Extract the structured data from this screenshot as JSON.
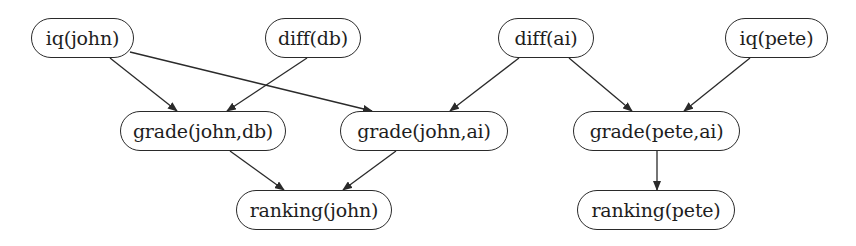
{
  "diagram": {
    "type": "directed-graph",
    "title": "",
    "nodes": [
      {
        "id": "iq_john",
        "label": "iq(john)",
        "x": 31,
        "y": 18,
        "w": 103,
        "h": 40
      },
      {
        "id": "diff_db",
        "label": "diff(db)",
        "x": 265,
        "y": 18,
        "w": 96,
        "h": 40
      },
      {
        "id": "diff_ai",
        "label": "diff(ai)",
        "x": 498,
        "y": 18,
        "w": 96,
        "h": 40
      },
      {
        "id": "iq_pete",
        "label": "iq(pete)",
        "x": 725,
        "y": 18,
        "w": 103,
        "h": 40
      },
      {
        "id": "grade_john_db",
        "label": "grade(john,db)",
        "x": 120,
        "y": 111,
        "w": 166,
        "h": 40
      },
      {
        "id": "grade_john_ai",
        "label": "grade(john,ai)",
        "x": 340,
        "y": 111,
        "w": 168,
        "h": 40
      },
      {
        "id": "grade_pete_ai",
        "label": "grade(pete,ai)",
        "x": 573,
        "y": 111,
        "w": 167,
        "h": 40
      },
      {
        "id": "ranking_john",
        "label": "ranking(john)",
        "x": 236,
        "y": 190,
        "w": 156,
        "h": 40
      },
      {
        "id": "ranking_pete",
        "label": "ranking(pete)",
        "x": 577,
        "y": 190,
        "w": 158,
        "h": 40
      }
    ],
    "edges": [
      {
        "from": "iq_john",
        "to": "grade_john_db"
      },
      {
        "from": "iq_john",
        "to": "grade_john_ai"
      },
      {
        "from": "diff_db",
        "to": "grade_john_db"
      },
      {
        "from": "diff_ai",
        "to": "grade_john_ai"
      },
      {
        "from": "diff_ai",
        "to": "grade_pete_ai"
      },
      {
        "from": "iq_pete",
        "to": "grade_pete_ai"
      },
      {
        "from": "grade_john_db",
        "to": "ranking_john"
      },
      {
        "from": "grade_john_ai",
        "to": "ranking_john"
      },
      {
        "from": "grade_pete_ai",
        "to": "ranking_pete"
      }
    ],
    "edge_paths": [
      {
        "from": "iq_john",
        "to": "grade_john_db",
        "x1": 110,
        "y1": 58,
        "x2": 177,
        "y2": 111
      },
      {
        "from": "iq_john",
        "to": "grade_john_ai",
        "x1": 130,
        "y1": 52,
        "x2": 372,
        "y2": 111
      },
      {
        "from": "diff_db",
        "to": "grade_john_db",
        "x1": 307,
        "y1": 58,
        "x2": 227,
        "y2": 111
      },
      {
        "from": "diff_ai",
        "to": "grade_john_ai",
        "x1": 519,
        "y1": 58,
        "x2": 450,
        "y2": 111
      },
      {
        "from": "diff_ai",
        "to": "grade_pete_ai",
        "x1": 569,
        "y1": 58,
        "x2": 632,
        "y2": 111
      },
      {
        "from": "iq_pete",
        "to": "grade_pete_ai",
        "x1": 750,
        "y1": 58,
        "x2": 684,
        "y2": 111
      },
      {
        "from": "grade_john_db",
        "to": "ranking_john",
        "x1": 230,
        "y1": 151,
        "x2": 284,
        "y2": 190
      },
      {
        "from": "grade_john_ai",
        "to": "ranking_john",
        "x1": 396,
        "y1": 151,
        "x2": 343,
        "y2": 190
      },
      {
        "from": "grade_pete_ai",
        "to": "ranking_pete",
        "x1": 657,
        "y1": 151,
        "x2": 657,
        "y2": 190
      }
    ],
    "colors": {
      "stroke": "#2a2a2a",
      "text": "#1e1e1e",
      "background": "#ffffff"
    }
  }
}
